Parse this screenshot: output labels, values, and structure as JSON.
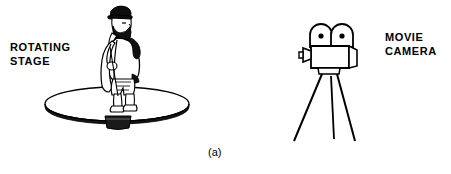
{
  "figure": {
    "caption": "(a)",
    "background_color": "#ffffff",
    "ink_color": "#000000",
    "width": 451,
    "height": 174
  },
  "labels": {
    "rotating_stage": "ROTATING\nSTAGE",
    "rotating_stage_line1": "ROTATING",
    "rotating_stage_line2": "STAGE",
    "movie_camera": "MOVIE\nCAMERA",
    "movie_camera_line1": "MOVIE",
    "movie_camera_line2": "CAMERA"
  },
  "scene": {
    "left_subject": {
      "name": "rotating-stage-with-man",
      "parts": [
        "man-figure",
        "cap",
        "beard",
        "coat",
        "trousers",
        "boots",
        "turntable-disc",
        "pedestal-base"
      ]
    },
    "right_subject": {
      "name": "movie-camera-on-tripod",
      "parts": [
        "film-reel-left",
        "film-reel-right",
        "camera-body",
        "lens-funnel",
        "tripod-head",
        "tripod-leg-left",
        "tripod-leg-center",
        "tripod-leg-right"
      ]
    }
  }
}
